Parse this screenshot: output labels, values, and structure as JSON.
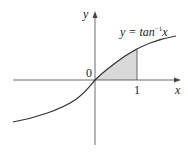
{
  "figure": {
    "function_label_prefix": "y = tan",
    "function_label_exp": "−1",
    "function_label_var": "x",
    "x_axis_label": "x",
    "y_axis_label": "y",
    "origin_label": "0",
    "tick_label": "1",
    "colors": {
      "curve": "#333333",
      "axis": "#444444",
      "shade": "#d9d9d9"
    }
  }
}
